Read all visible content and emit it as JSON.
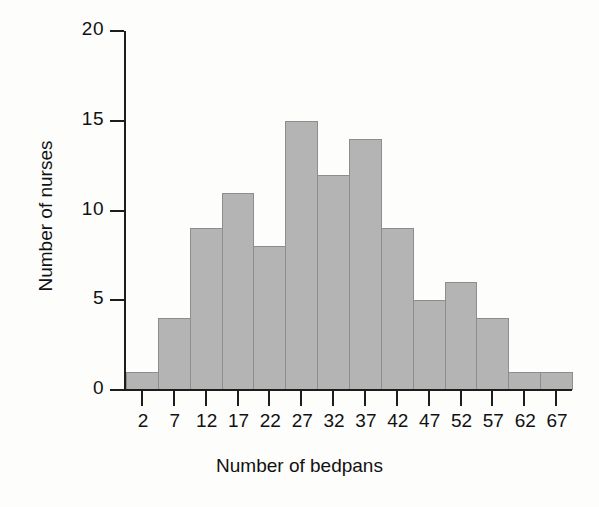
{
  "chart_data": {
    "type": "bar",
    "title": "",
    "subtitle": "",
    "xlabel": "Number of bedpans",
    "ylabel": "Number of nurses",
    "categories": [
      "2",
      "7",
      "12",
      "17",
      "22",
      "27",
      "32",
      "37",
      "42",
      "47",
      "52",
      "57",
      "62",
      "67"
    ],
    "values": [
      1,
      4,
      9,
      11,
      8,
      15,
      12,
      14,
      9,
      5,
      6,
      4,
      1,
      1
    ],
    "x_tick_labels": [
      "2",
      "7",
      "12",
      "17",
      "22",
      "27",
      "32",
      "37",
      "42",
      "47",
      "52",
      "57",
      "62",
      "67"
    ],
    "y_tick_labels": [
      "0",
      "5",
      "10",
      "15",
      "20"
    ],
    "y_ticks": [
      0,
      5,
      10,
      15,
      20
    ],
    "ylim": [
      0,
      20
    ],
    "grid": false,
    "legend": false,
    "bin_width": 5,
    "bar_color": "#b4b4b4",
    "bar_edge_color": "#8d8d8d",
    "axis_color": "#1d1d1d",
    "background_color": "#fdfdfc",
    "annotations": []
  }
}
